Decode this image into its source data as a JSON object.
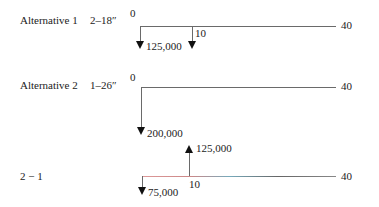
{
  "rows": [
    {
      "label": "Alternative 1",
      "spec": "2–18″",
      "start": "0",
      "end": "40",
      "mid": "10",
      "cashflows": [
        {
          "period": 0,
          "amount": "125,000",
          "dir": "down"
        },
        {
          "period": 10,
          "amount": "",
          "dir": "down"
        }
      ]
    },
    {
      "label": "Alternative 2",
      "spec": "1–26″",
      "start": "0",
      "end": "40",
      "cashflows": [
        {
          "period": 0,
          "amount": "200,000",
          "dir": "down"
        }
      ]
    },
    {
      "label": "2 − 1",
      "end": "40",
      "mid": "10",
      "cashflows": [
        {
          "period": 0,
          "amount": "75,000",
          "dir": "down"
        },
        {
          "period": 10,
          "amount": "125,000",
          "dir": "up"
        }
      ]
    }
  ]
}
